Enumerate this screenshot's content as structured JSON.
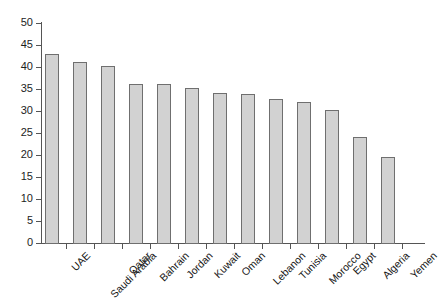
{
  "chart_data": {
    "type": "bar",
    "title": "",
    "subtitle": "",
    "xlabel": "",
    "ylabel": "",
    "ylim": [
      0,
      50
    ],
    "yticks": [
      0,
      5,
      10,
      15,
      20,
      25,
      30,
      35,
      40,
      45,
      50
    ],
    "ytick_labels": [
      "0",
      "5",
      "10",
      "15",
      "20",
      "25",
      "30",
      "35",
      "40",
      "45",
      "50"
    ],
    "grid": false,
    "legend": false,
    "legend_position": "none",
    "bar_fill_color": "#d2d2d2",
    "bar_edge_color": "#6f6f6f",
    "axis_color": "#555555",
    "background_color": "#ffffff",
    "categories": [
      "UAE",
      "Saudi Arabia",
      "Qatar",
      "Bahrain",
      "Jordan",
      "Kuwait",
      "Oman",
      "Lebanon",
      "Tunisia",
      "Morocco",
      "Egypt",
      "Algeria",
      "Yemen"
    ],
    "values": [
      43.0,
      41.1,
      40.2,
      36.2,
      36.1,
      35.3,
      34.0,
      33.8,
      32.8,
      32.1,
      30.2,
      24.1,
      19.5
    ]
  }
}
